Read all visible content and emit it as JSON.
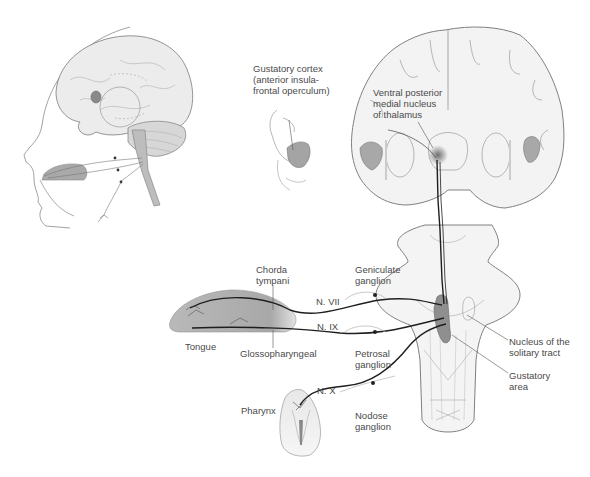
{
  "diagram": {
    "colors": {
      "background": "#ffffff",
      "outline": "#7a7a7a",
      "tissue_fill": "#f1f1f1",
      "shading_dark": "#8c8c8c",
      "shading_mid": "#b5b5b5",
      "nerve": "#1e1e1e",
      "label_text": "#4a4a4a"
    },
    "panels": {
      "lateral_head": "Lateral view of head with brain, tongue and nerves",
      "coronal_section": "Coronal section of forebrain",
      "insula_inset": "Inset of insular cortex",
      "brainstem": "Dorsal view of brainstem",
      "tongue": "Tongue",
      "pharynx": "Pharynx"
    },
    "labels": {
      "gustatory_cortex": "Gustatory cortex\n(anterior insula-\nfrontal operculum)",
      "vpm_thalamus": "Ventral posterior\nmedial nucleus\nof thalamus",
      "chorda_tympani": "Chorda\ntympani",
      "geniculate_ganglion": "Geniculate\nganglion",
      "n_vii": "N. VII",
      "n_ix": "N. IX",
      "n_x": "N. X",
      "tongue": "Tongue",
      "glossopharyngeal": "Glossopharyngeal",
      "petrosal_ganglion": "Petrosal\nganglion",
      "nucleus_solitary_tract": "Nucleus of the\nsolitary tract",
      "gustatory_area": "Gustatory\narea",
      "pharynx": "Pharynx",
      "nodose_ganglion": "Nodose\nganglion"
    }
  }
}
